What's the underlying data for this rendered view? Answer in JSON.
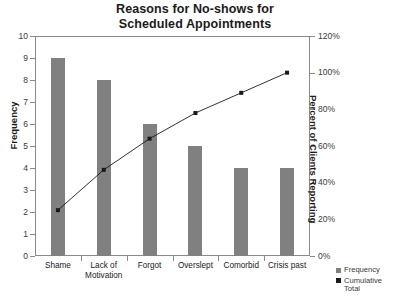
{
  "chart_data": {
    "type": "bar",
    "title": "Reasons for No-shows for Scheduled Appointments",
    "title_line1": "Reasons for No-shows for",
    "title_line2": "Scheduled Appointments",
    "categories": [
      "Shame",
      "Lack of Motivation",
      "Forgot",
      "Overslept",
      "Comorbid",
      "Crisis past"
    ],
    "category_lines": [
      [
        "Shame"
      ],
      [
        "Lack of",
        "Motivation"
      ],
      [
        "Forgot"
      ],
      [
        "Overslept"
      ],
      [
        "Comorbid"
      ],
      [
        "Crisis past"
      ]
    ],
    "series": [
      {
        "name": "Frequency",
        "type": "bar",
        "axis": "left",
        "color": "#808080",
        "values": [
          9,
          8,
          6,
          5,
          4,
          4
        ]
      },
      {
        "name": "Cumulative Total",
        "type": "line",
        "axis": "right",
        "color": "#1a1a1a",
        "values": [
          25,
          47,
          64,
          78,
          89,
          100
        ],
        "value_labels": [
          "25%",
          "47%",
          "64%",
          "78%",
          "89%",
          "100%"
        ]
      }
    ],
    "xlabel": "",
    "ylabel": "Frequency",
    "y2label": "Percent of Clients Reporting",
    "ylim": [
      0,
      10
    ],
    "y2lim": [
      0,
      120
    ],
    "yticks": [
      0,
      1,
      2,
      3,
      4,
      5,
      6,
      7,
      8,
      9,
      10
    ],
    "ytick_labels": [
      "0",
      "1",
      "2",
      "3",
      "4",
      "5",
      "6",
      "7",
      "8",
      "9",
      "10"
    ],
    "y2ticks": [
      0,
      20,
      40,
      60,
      80,
      100,
      120
    ],
    "y2tick_labels": [
      "0%",
      "20%",
      "40%",
      "60%",
      "80%",
      "100%",
      "120%"
    ],
    "grid": false,
    "legend_position": "bottom-right",
    "legend": [
      {
        "label": "Frequency",
        "color": "#808080",
        "marker": "square"
      },
      {
        "label": "Cumulative\nTotal",
        "color": "#1a1a1a",
        "marker": "square"
      }
    ],
    "total_frequency": 36
  },
  "colors": {
    "bar": "#808080",
    "line": "#1a1a1a",
    "axis": "#8a8a8a",
    "text": "#1a1a1a",
    "tick_text": "#3a3a3a",
    "background": "#ffffff"
  }
}
